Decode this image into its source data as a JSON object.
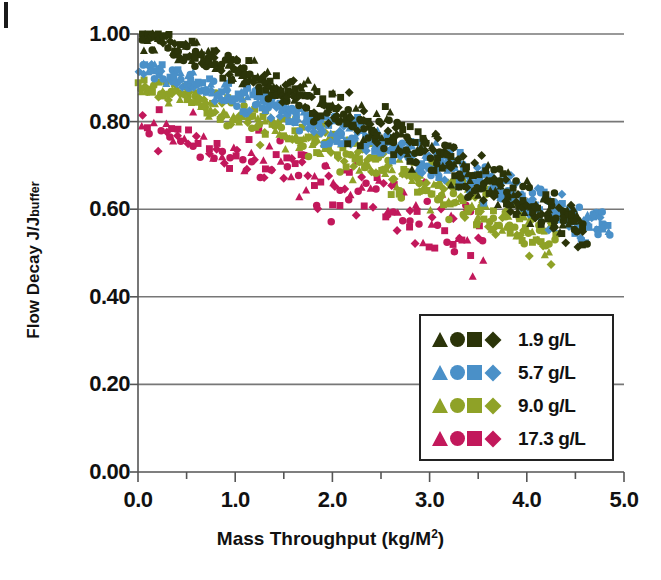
{
  "chart_data": {
    "type": "scatter",
    "title": "",
    "xlabel": "Mass Throughput (kg/M2)",
    "xlabel_base": "Mass Throughput (kg/M",
    "xlabel_sup": "2",
    "xlabel_tail": ")",
    "ylabel": "Flow Decay J/J",
    "ylabel_sub": "buffer",
    "xlim": [
      0.0,
      5.0
    ],
    "ylim": [
      0.0,
      1.0
    ],
    "xticks": [
      "0.0",
      "1.0",
      "2.0",
      "3.0",
      "4.0",
      "5.0"
    ],
    "xtick_values": [
      0.0,
      1.0,
      2.0,
      3.0,
      4.0,
      5.0
    ],
    "xminor_step": 0.5,
    "yticks": [
      "0.00",
      "0.20",
      "0.40",
      "0.60",
      "0.80",
      "1.00"
    ],
    "ytick_values": [
      0.0,
      0.2,
      0.4,
      0.6,
      0.8,
      1.0
    ],
    "grid": "horizontal",
    "legend_position": "inside-bottom-right",
    "colors": {
      "series_1_9": "#2b3409",
      "series_5_7": "#4a90c8",
      "series_9_0": "#8fa227",
      "series_17_3": "#c2185b",
      "axis": "#555555",
      "grid": "#777777"
    },
    "marker_shapes": [
      "triangle",
      "circle",
      "square",
      "diamond"
    ],
    "series": [
      {
        "name": "1.9 g/L",
        "concentration": 1.9,
        "unit": "g/L",
        "color": "#2b3409",
        "x_range": [
          0.0,
          4.6
        ],
        "y_start": 1.0,
        "y_end": 0.55,
        "n_points": 420,
        "scatter_band": 0.035
      },
      {
        "name": "5.7 g/L",
        "concentration": 5.7,
        "unit": "g/L",
        "color": "#4a90c8",
        "x_range": [
          0.0,
          4.85
        ],
        "y_start": 0.925,
        "y_end": 0.545,
        "n_points": 400,
        "scatter_band": 0.03
      },
      {
        "name": "9.0 g/L",
        "concentration": 9.0,
        "unit": "g/L",
        "color": "#8fa227",
        "x_range": [
          0.0,
          4.3
        ],
        "y_start": 0.89,
        "y_end": 0.52,
        "n_points": 330,
        "scatter_band": 0.035
      },
      {
        "name": "17.3 g/L",
        "concentration": 17.3,
        "unit": "g/L",
        "color": "#c2185b",
        "x_range": [
          0.0,
          3.55
        ],
        "y_start": 0.8,
        "y_end": 0.52,
        "n_points": 150,
        "scatter_band": 0.05
      }
    ],
    "legend_entries": [
      {
        "label": "1.9 g/L",
        "color": "#2b3409"
      },
      {
        "label": "5.7 g/L",
        "color": "#4a90c8"
      },
      {
        "label": "9.0 g/L",
        "color": "#8fa227"
      },
      {
        "label": "17.3 g/L",
        "color": "#c2185b"
      }
    ]
  }
}
